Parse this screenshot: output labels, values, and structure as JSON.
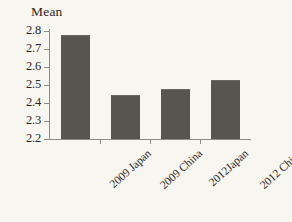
{
  "chart_data": {
    "type": "bar",
    "title": "",
    "xlabel": "",
    "ylabel": "Mean",
    "categories": [
      "2009 Japan",
      "2009 China",
      "2012Japan",
      "2012 China"
    ],
    "values": [
      2.77,
      2.44,
      2.47,
      2.52
    ],
    "ylim": [
      2.2,
      2.8
    ],
    "ytick_labels": [
      "2.8",
      "2.7",
      "2.6",
      "2.5",
      "2.4",
      "2.3",
      "2.2"
    ],
    "ytick_values": [
      2.8,
      2.7,
      2.6,
      2.5,
      2.4,
      2.3,
      2.2
    ],
    "grid": false,
    "legend": false,
    "legend_position": "none",
    "bar_color": "#585550",
    "axis_color": "#8e8b85",
    "text_color": "#2b2824",
    "background_color": "#f8f6f1",
    "series": [
      {
        "name": "Mean",
        "values": [
          2.77,
          2.44,
          2.47,
          2.52
        ]
      }
    ]
  }
}
